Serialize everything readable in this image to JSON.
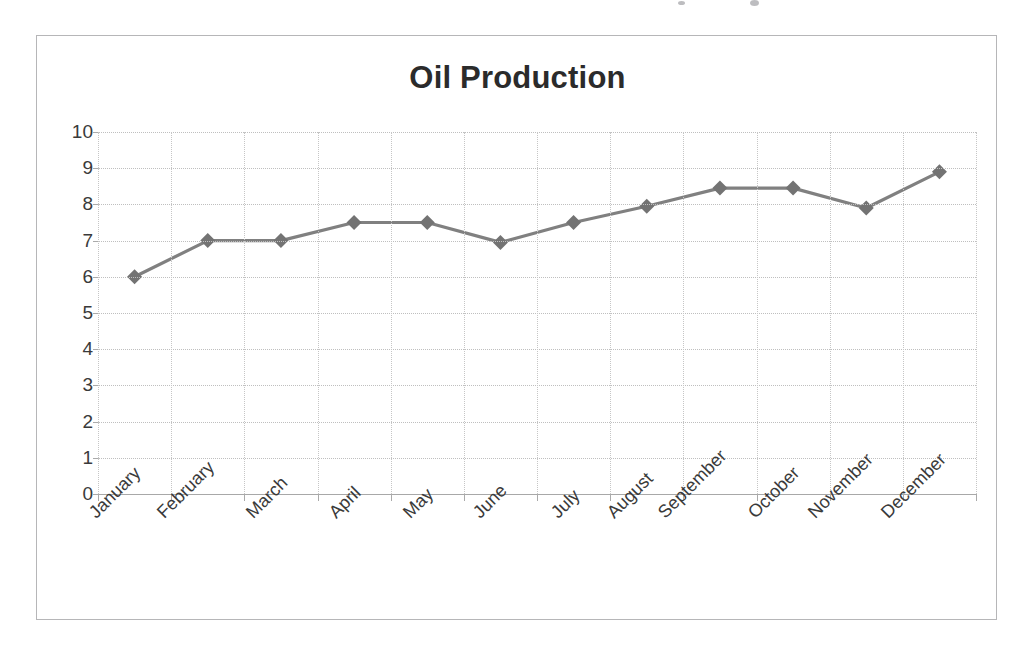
{
  "chart": {
    "title": "Oil Production",
    "line_color": "#808080",
    "marker_color": "#737373",
    "grid_color": "#bfbfbf",
    "text_color": "#3a3a3a",
    "title_color": "#2b2b2b",
    "border_color": "#b6b6b8",
    "background": "#ffffff"
  },
  "chart_data": {
    "type": "line",
    "title": "Oil Production",
    "xlabel": "",
    "ylabel": "",
    "categories": [
      "January",
      "February",
      "March",
      "April",
      "May",
      "June",
      "July",
      "August",
      "September",
      "October",
      "November",
      "December"
    ],
    "values": [
      6.0,
      7.0,
      7.0,
      7.5,
      7.5,
      6.95,
      7.5,
      7.95,
      8.45,
      8.45,
      7.9,
      8.9
    ],
    "series": [
      {
        "name": "Oil Production",
        "values": [
          6.0,
          7.0,
          7.0,
          7.5,
          7.5,
          6.95,
          7.5,
          7.95,
          8.45,
          8.45,
          7.9,
          8.9
        ]
      }
    ],
    "ylim": [
      0,
      10
    ],
    "ytick_step": 1,
    "yticks": [
      10,
      9,
      8,
      7,
      6,
      5,
      4,
      3,
      2,
      1,
      0
    ],
    "grid": true,
    "grid_axis": "y",
    "legend": false,
    "legend_position": "none",
    "marker": "diamond",
    "xtick_label_rotation": -45
  }
}
